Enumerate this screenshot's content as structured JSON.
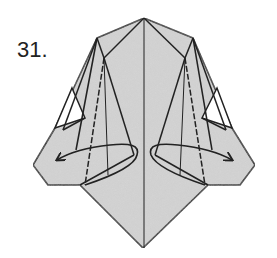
{
  "step": {
    "number_label": "31."
  },
  "diagram": {
    "paper_color": "#d9d9d9",
    "line_color": "#222222",
    "background": "#ffffff",
    "arrows": [
      {
        "direction": "left",
        "label": "swing-flap-left"
      },
      {
        "direction": "right",
        "label": "swing-flap-right"
      }
    ]
  }
}
